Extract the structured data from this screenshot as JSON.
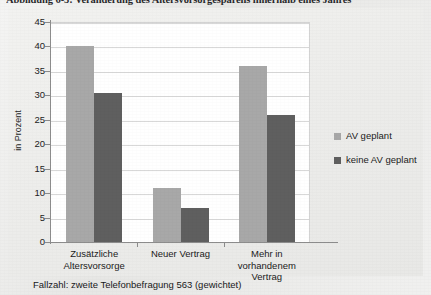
{
  "figure": {
    "caption": "Abbildung 6-5: Veränderung des Altersvorsorgesparens innerhalb eines Jahres",
    "footnote": "Fallzahl: zweite Telefonbefragung 563 (gewichtet)"
  },
  "colors": {
    "series_av_geplant": "#a8a8a8",
    "series_keine_av_geplant": "#5f5f5f",
    "plot_background": "#ffffff",
    "chart_background": "#ececeA",
    "gridline": "#d8d8d8",
    "axis": "#8c8c8c"
  },
  "legend": {
    "position": "right",
    "entries": [
      {
        "label": "AV geplant",
        "color": "#a8a8a8"
      },
      {
        "label": "keine AV geplant",
        "color": "#5f5f5f"
      }
    ]
  },
  "axis": {
    "y_title": "in Prozent",
    "y_ticks": [
      "0",
      "5",
      "10",
      "15",
      "20",
      "25",
      "30",
      "35",
      "40",
      "45"
    ]
  },
  "chart_data": {
    "type": "bar",
    "title": "Abbildung 6-5: Veränderung des Altersvorsorgesparens innerhalb eines Jahres",
    "xlabel": "",
    "ylabel": "in Prozent",
    "ylim": [
      0,
      45
    ],
    "ytick_step": 5,
    "grid": true,
    "legend_position": "right",
    "categories": [
      "Zusätzliche Altersvorsorge",
      "Neuer Vertrag",
      "Mehr in vorhandenem Vertrag"
    ],
    "series": [
      {
        "name": "AV geplant",
        "color": "#a8a8a8",
        "values": [
          40,
          11,
          36
        ]
      },
      {
        "name": "keine AV geplant",
        "color": "#5f5f5f",
        "values": [
          30.5,
          7,
          26
        ]
      }
    ],
    "annotations": [
      "Fallzahl: zweite Telefonbefragung 563 (gewichtet)"
    ]
  }
}
